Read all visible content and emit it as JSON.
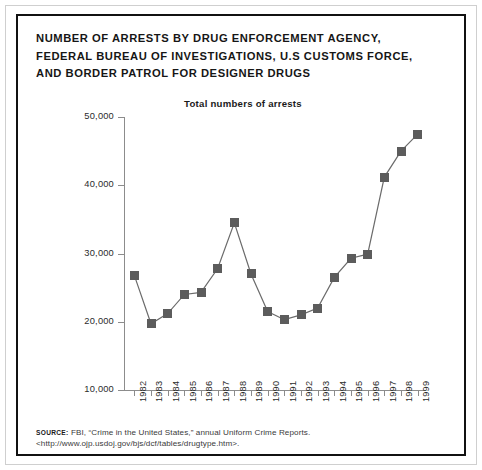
{
  "figure": {
    "title_lines": [
      "NUMBER OF ARRESTS BY DRUG ENFORCEMENT AGENCY,",
      "FEDERAL BUREAU OF INVESTIGATIONS, U.S CUSTOMS FORCE,",
      "AND BORDER PATROL FOR DESIGNER DRUGS"
    ],
    "source_label": "SOURCE:",
    "source_text": "FBI, “Crime in the United States,” annual Uniform Crime Reports. <http://www.ojp.usdoj.gov/bjs/dcf/tables/drugtype.htm>.",
    "colors": {
      "frame": "#111111",
      "marker": "#5c5c5c",
      "line": "#6b6b6b",
      "axis": "#8c8c8c",
      "text": "#2b2b2b",
      "background": "#ffffff"
    }
  },
  "chart_data": {
    "type": "line",
    "title": "Total numbers of arrests",
    "xlabel": "",
    "ylabel": "",
    "grid": false,
    "legend": "none",
    "ylim": [
      10000,
      50000
    ],
    "ytick_labels": [
      "50,000",
      "40,000",
      "30,000",
      "20,000",
      "10,000"
    ],
    "ytick_values": [
      50000,
      40000,
      30000,
      20000,
      10000
    ],
    "categories": [
      "1982",
      "1983",
      "1984",
      "1985",
      "1986",
      "1987",
      "1988",
      "1989",
      "1990",
      "1991",
      "1992",
      "1993",
      "1994",
      "1995",
      "1996",
      "1997",
      "1998",
      "1999"
    ],
    "series": [
      {
        "name": "Total numbers of arrests",
        "values": [
          26800,
          19700,
          21200,
          24000,
          24300,
          27800,
          34500,
          27000,
          21500,
          20300,
          21000,
          22000,
          26500,
          29300,
          29900,
          41200,
          45000,
          47500
        ]
      }
    ]
  }
}
